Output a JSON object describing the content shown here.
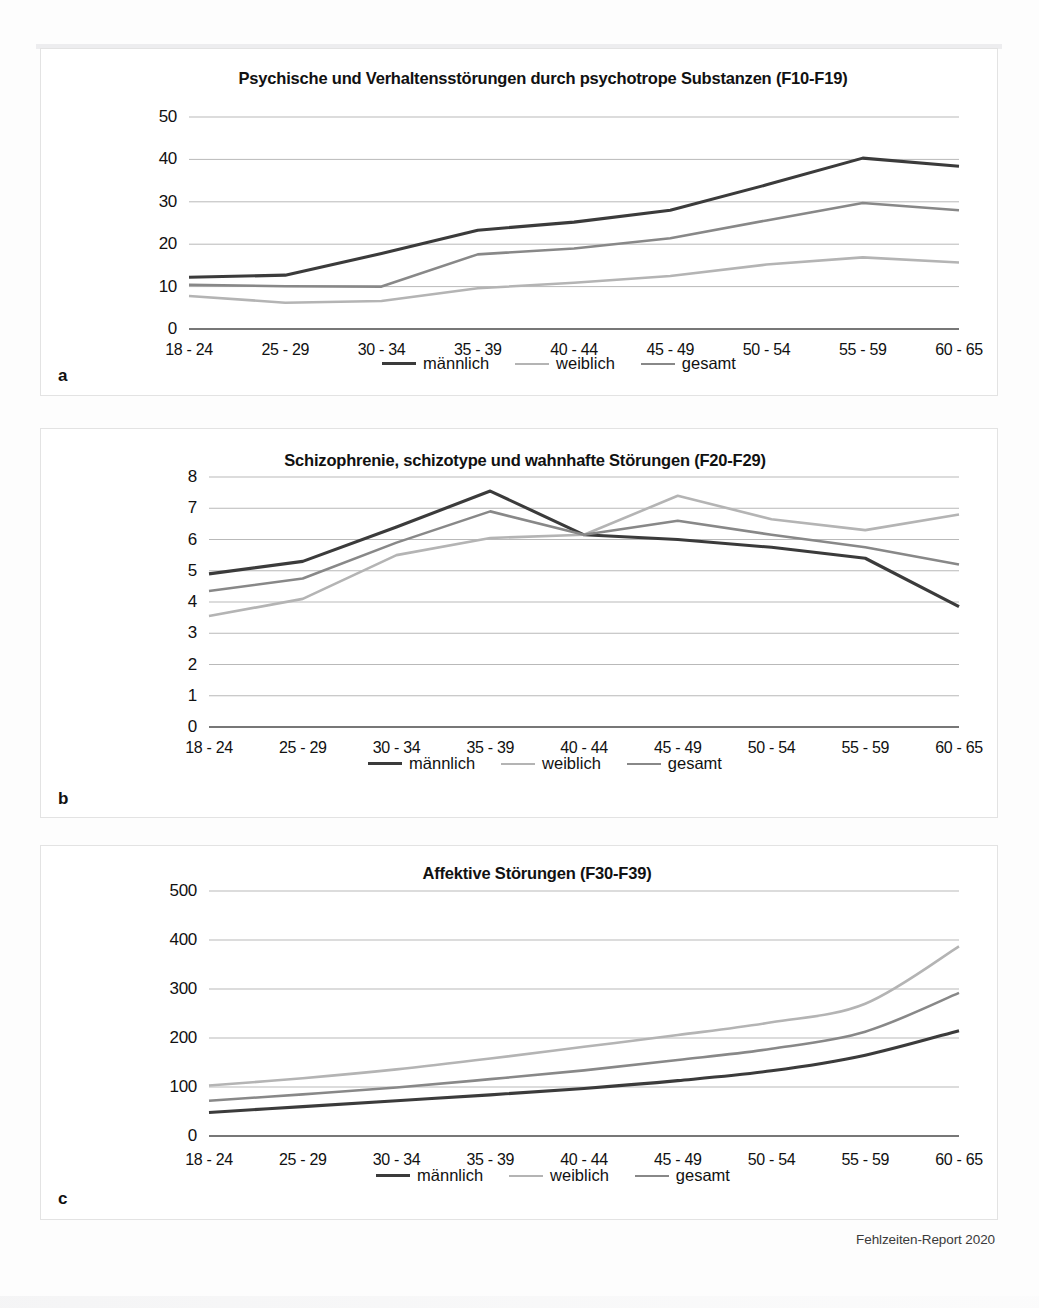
{
  "figure": {
    "source_note": "Fehlzeiten-Report 2020",
    "panels": [
      {
        "letter": "a"
      },
      {
        "letter": "b"
      },
      {
        "letter": "c"
      }
    ]
  },
  "legend": {
    "mann": "männlich",
    "weib": "weiblich",
    "ges": "gesamt"
  },
  "colors": {
    "mann": "#3b3b3b",
    "weib": "#b4b4b4",
    "ges": "#888888",
    "gridline": "#b9b9b9",
    "axis": "#4a4a4a",
    "panel_border": "#e3e3e3"
  },
  "chart_data": [
    {
      "type": "line",
      "panel": "a",
      "title": "Psychische und Verhaltensstörungen durch psychotrope Substanzen (F10-F19)",
      "xlabel": "",
      "ylabel": "",
      "categories": [
        "18 - 24",
        "25 - 29",
        "30 - 34",
        "35 - 39",
        "40 - 44",
        "45 - 49",
        "50 - 54",
        "55 - 59",
        "60 - 65"
      ],
      "yticks": [
        0,
        10,
        20,
        30,
        40,
        50
      ],
      "ylim": [
        0,
        50
      ],
      "grid": true,
      "legend_position": "bottom",
      "series": [
        {
          "name": "männlich",
          "values": [
            12.2,
            12.7,
            17.8,
            23.3,
            25.2,
            28.0,
            34.0,
            40.3,
            38.4
          ]
        },
        {
          "name": "weiblich",
          "values": [
            7.8,
            6.2,
            6.6,
            9.6,
            10.9,
            12.5,
            15.2,
            16.9,
            15.7
          ]
        },
        {
          "name": "gesamt",
          "values": [
            10.4,
            10.1,
            10.0,
            17.6,
            19.0,
            21.4,
            25.6,
            29.7,
            28.0
          ]
        }
      ]
    },
    {
      "type": "line",
      "panel": "b",
      "title": "Schizophrenie, schizotype und wahnhafte Störungen (F20-F29)",
      "xlabel": "",
      "ylabel": "",
      "categories": [
        "18 - 24",
        "25 - 29",
        "30 - 34",
        "35 - 39",
        "40 - 44",
        "45 - 49",
        "50 - 54",
        "55 - 59",
        "60 - 65"
      ],
      "yticks": [
        0,
        1,
        2,
        3,
        4,
        5,
        6,
        7,
        8
      ],
      "ylim": [
        0,
        8
      ],
      "grid": true,
      "legend_position": "bottom",
      "series": [
        {
          "name": "männlich",
          "values": [
            4.9,
            5.3,
            6.4,
            7.55,
            6.15,
            6.0,
            5.75,
            5.4,
            3.85
          ]
        },
        {
          "name": "weiblich",
          "values": [
            3.55,
            4.1,
            5.5,
            6.05,
            6.15,
            7.4,
            6.65,
            6.3,
            6.8
          ]
        },
        {
          "name": "gesamt",
          "values": [
            4.35,
            4.75,
            5.9,
            6.9,
            6.15,
            6.6,
            6.15,
            5.75,
            5.2
          ]
        }
      ]
    },
    {
      "type": "line",
      "panel": "c",
      "title": "Affektive Störungen (F30-F39)",
      "xlabel": "",
      "ylabel": "",
      "categories": [
        "18 - 24",
        "25 - 29",
        "30 - 34",
        "35 - 39",
        "40 - 44",
        "45 - 49",
        "50 - 54",
        "55 - 59",
        "60 - 65"
      ],
      "yticks": [
        0,
        100,
        200,
        300,
        400,
        500
      ],
      "ylim": [
        0,
        500
      ],
      "grid": true,
      "legend_position": "bottom",
      "series": [
        {
          "name": "männlich",
          "values": [
            48,
            60,
            72,
            84,
            97,
            113,
            133,
            165,
            215
          ]
        },
        {
          "name": "weiblich",
          "values": [
            103,
            118,
            136,
            158,
            182,
            206,
            232,
            270,
            387
          ]
        },
        {
          "name": "gesamt",
          "values": [
            72,
            85,
            99,
            116,
            134,
            155,
            178,
            213,
            292
          ]
        }
      ]
    }
  ]
}
